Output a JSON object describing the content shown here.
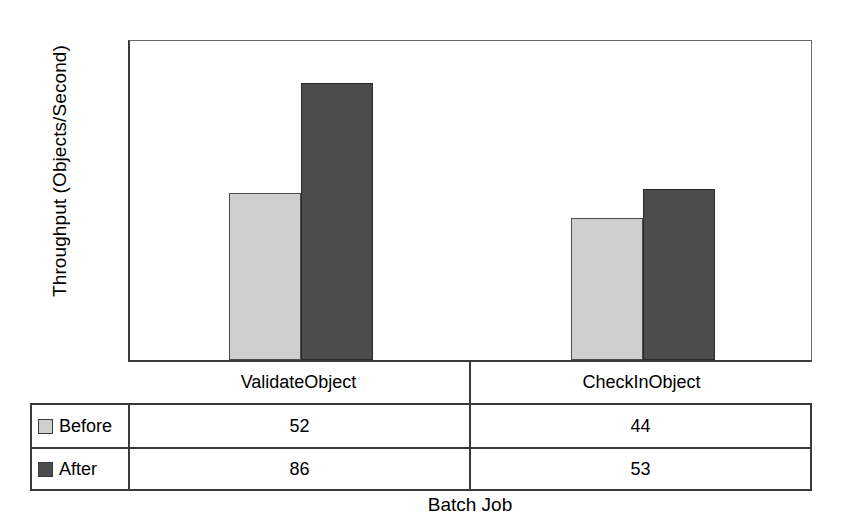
{
  "chart_data": {
    "type": "bar",
    "title": "",
    "xlabel": "Batch Job",
    "ylabel": "Throughput (Objects/Second)",
    "categories": [
      "ValidateObject",
      "CheckInObject"
    ],
    "series": [
      {
        "name": "Before",
        "values": [
          52,
          44
        ],
        "color": "#cfcfcf"
      },
      {
        "name": "After",
        "values": [
          86,
          53
        ],
        "color": "#4c4c4c"
      }
    ],
    "ylim": [
      0,
      100
    ],
    "yticks": [
      0,
      20,
      40,
      60,
      80,
      100
    ],
    "ytick_labels": [
      "0",
      "20",
      "40",
      "60",
      "80",
      "100"
    ],
    "grid": false,
    "legend_position": "data-table-below-axis",
    "has_data_table": true
  },
  "axis": {
    "y_title": "Throughput (Objects/Second)",
    "x_title": "Batch Job",
    "y_ticks": [
      "100",
      "80",
      "60",
      "40",
      "20",
      "0"
    ]
  },
  "table": {
    "categories": [
      "ValidateObject",
      "CheckInObject"
    ],
    "rows": [
      {
        "label": "Before",
        "values": [
          "52",
          "44"
        ]
      },
      {
        "label": "After",
        "values": [
          "86",
          "53"
        ]
      }
    ]
  }
}
